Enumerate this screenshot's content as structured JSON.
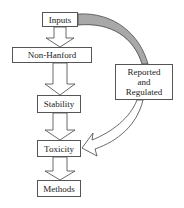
{
  "diagram": {
    "nodes": {
      "inputs": "Inputs",
      "non_hanford": "Non-Hanford",
      "stability": "Stability",
      "toxicity": "Toxicity",
      "methods": "Methods",
      "reported": "Reported and Regulated"
    },
    "edges": [
      {
        "from": "Inputs",
        "to": "Non-Hanford",
        "style": "hollow-block-arrow"
      },
      {
        "from": "Non-Hanford",
        "to": "Stability",
        "style": "hollow-block-arrow"
      },
      {
        "from": "Stability",
        "to": "Toxicity",
        "style": "hollow-block-arrow"
      },
      {
        "from": "Toxicity",
        "to": "Methods",
        "style": "hollow-block-arrow"
      },
      {
        "from": "Inputs",
        "to": "Reported and Regulated",
        "style": "shaded-curved-band"
      },
      {
        "from": "Reported and Regulated",
        "to": "Toxicity",
        "style": "hollow-curved-arrow"
      }
    ],
    "colors": {
      "border": "#555555",
      "band_fill": "#a8a8a8",
      "background": "#ffffff"
    }
  }
}
